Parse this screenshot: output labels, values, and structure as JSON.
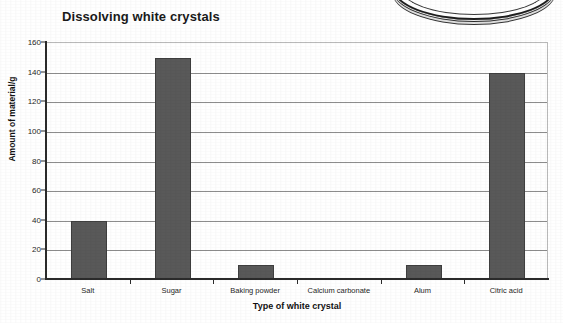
{
  "chart_data": {
    "type": "bar",
    "title": "Dissolving white crystals",
    "xlabel": "Type of white crystal",
    "ylabel": "Amount of material/g",
    "categories": [
      "Salt",
      "Sugar",
      "Baking powder",
      "Calcium carbonate",
      "Alum",
      "Citric acid"
    ],
    "values": [
      40,
      150,
      10,
      0,
      10,
      140
    ],
    "ylim": [
      0,
      160
    ],
    "ytick_labels": [
      "0",
      "20",
      "40",
      "60",
      "80",
      "100",
      "120",
      "140",
      "160"
    ],
    "ytick_values": [
      0,
      20,
      40,
      60,
      80,
      100,
      120,
      140,
      160
    ],
    "grid": "horizontal",
    "legend": "none",
    "bar_color": "#595959",
    "bar_border_color": "#3f3f3f",
    "gridline_color": "#8c8c8c",
    "axis_color": "#2b2b2b",
    "plot_border_color": "#b9b9b9"
  },
  "artifact": {
    "name": "partial circular dish illustration cropped at top edge"
  }
}
